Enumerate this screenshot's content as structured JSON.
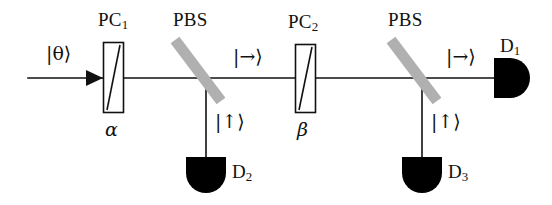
{
  "figure": {
    "type": "optical-setup-diagram",
    "width": 552,
    "height": 205,
    "background_color": "#ffffff",
    "line_color": "#111111",
    "beamsplitter_color": "#b0b0b0",
    "detector_color": "#000000"
  },
  "labels": {
    "pockels_cell_1": "PC",
    "pockels_cell_1_sub": "1",
    "pockels_cell_2": "PC",
    "pockels_cell_2_sub": "2",
    "beam_splitter_1": "PBS",
    "beam_splitter_2": "PBS",
    "detector_1": "D",
    "detector_1_sub": "1",
    "detector_2": "D",
    "detector_2_sub": "2",
    "detector_3": "D",
    "detector_3_sub": "3",
    "angle_alpha": "α",
    "angle_beta": "β"
  },
  "kets": {
    "input_state": "|θ⟩",
    "transmitted_1": "|→⟩",
    "transmitted_2": "|→⟩",
    "reflected_1": "|↑⟩",
    "reflected_2": "|↑⟩"
  },
  "components": [
    {
      "id": "input-beam",
      "kind": "beam",
      "label": "|θ⟩",
      "orientation": "horizontal",
      "from": [
        28,
        78
      ],
      "to": [
        103,
        78
      ],
      "arrow": true
    },
    {
      "id": "pockels-cell-1",
      "kind": "pockels-cell",
      "label": "PC1",
      "setting": "α",
      "rect": [
        103,
        42,
        21,
        71
      ]
    },
    {
      "id": "beam-splitter-1",
      "kind": "polarizing-beam-splitter",
      "label": "PBS",
      "angle_deg": 52,
      "from": [
        173,
        38
      ],
      "to": [
        223,
        103
      ]
    },
    {
      "id": "detector-2",
      "kind": "detector",
      "label": "D2",
      "input_state": "|↑⟩",
      "orientation": "down",
      "position": [
        206,
        160
      ]
    },
    {
      "id": "pockels-cell-2",
      "kind": "pockels-cell",
      "label": "PC2",
      "setting": "β",
      "rect": [
        295,
        44,
        21,
        69
      ]
    },
    {
      "id": "beam-splitter-2",
      "kind": "polarizing-beam-splitter",
      "label": "PBS",
      "angle_deg": 52,
      "from": [
        389,
        38
      ],
      "to": [
        439,
        103
      ]
    },
    {
      "id": "detector-3",
      "kind": "detector",
      "label": "D3",
      "input_state": "|↑⟩",
      "orientation": "down",
      "position": [
        422,
        160
      ]
    },
    {
      "id": "detector-1",
      "kind": "detector",
      "label": "D1",
      "input_state": "|→⟩",
      "orientation": "right",
      "position": [
        500,
        78
      ]
    }
  ]
}
